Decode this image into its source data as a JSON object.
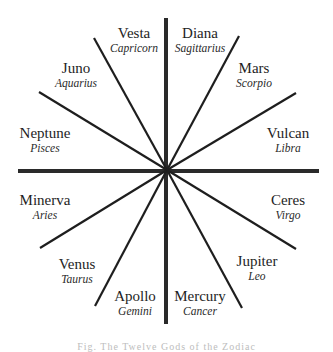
{
  "diagram": {
    "center": [
      167,
      170
    ],
    "axis_color": "#2a2a2a",
    "line_color": "#1e1e1e",
    "lines": [
      {
        "name": "vertical-axis",
        "x1": 166,
        "y1": 18,
        "x2": 166,
        "y2": 324,
        "type": "axis"
      },
      {
        "name": "horizontal-axis",
        "x1": 18,
        "y1": 171,
        "x2": 319,
        "y2": 171,
        "type": "axis"
      },
      {
        "name": "spoke-vesta-juno",
        "x1": 94,
        "y1": 38,
        "x2": 167,
        "y2": 170,
        "type": "spoke"
      },
      {
        "name": "spoke-juno-neptune",
        "x1": 39,
        "y1": 92,
        "x2": 167,
        "y2": 170,
        "type": "spoke"
      },
      {
        "name": "spoke-diana-mars",
        "x1": 239,
        "y1": 36,
        "x2": 167,
        "y2": 170,
        "type": "spoke"
      },
      {
        "name": "spoke-mars-vulcan",
        "x1": 296,
        "y1": 93,
        "x2": 167,
        "y2": 170,
        "type": "spoke"
      },
      {
        "name": "spoke-minerva-venus",
        "x1": 40,
        "y1": 248,
        "x2": 167,
        "y2": 170,
        "type": "spoke"
      },
      {
        "name": "spoke-venus-apollo",
        "x1": 95,
        "y1": 306,
        "x2": 167,
        "y2": 170,
        "type": "spoke"
      },
      {
        "name": "spoke-ceres-jupiter",
        "x1": 296,
        "y1": 249,
        "x2": 167,
        "y2": 170,
        "type": "spoke"
      },
      {
        "name": "spoke-jupiter-mercury",
        "x1": 242,
        "y1": 308,
        "x2": 167,
        "y2": 170,
        "type": "spoke"
      }
    ],
    "segments": [
      {
        "god": "Vesta",
        "sign": "Capricorn",
        "x": 134,
        "y": 26
      },
      {
        "god": "Diana",
        "sign": "Sagittarius",
        "x": 200,
        "y": 26
      },
      {
        "god": "Juno",
        "sign": "Aquarius",
        "x": 76,
        "y": 61
      },
      {
        "god": "Mars",
        "sign": "Scorpio",
        "x": 254,
        "y": 61
      },
      {
        "god": "Neptune",
        "sign": "Pisces",
        "x": 45,
        "y": 126
      },
      {
        "god": "Vulcan",
        "sign": "Libra",
        "x": 288,
        "y": 126
      },
      {
        "god": "Minerva",
        "sign": "Aries",
        "x": 45,
        "y": 193
      },
      {
        "god": "Ceres",
        "sign": "Virgo",
        "x": 288,
        "y": 193
      },
      {
        "god": "Venus",
        "sign": "Taurus",
        "x": 77,
        "y": 257
      },
      {
        "god": "Jupiter",
        "sign": "Leo",
        "x": 257,
        "y": 254
      },
      {
        "god": "Apollo",
        "sign": "Gemini",
        "x": 135,
        "y": 289
      },
      {
        "god": "Mercury",
        "sign": "Cancer",
        "x": 200,
        "y": 289
      }
    ],
    "caption": "Fig. The Twelve Gods of the Zodiac"
  }
}
